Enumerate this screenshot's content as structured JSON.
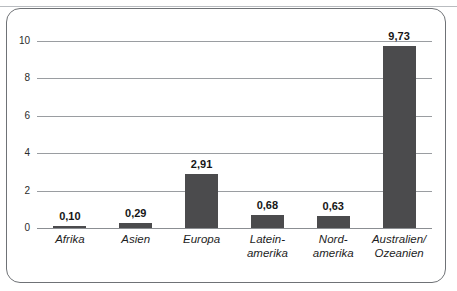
{
  "figure": {
    "frame_color": "#6f7276",
    "background": "#ffffff"
  },
  "chart_data": {
    "type": "bar",
    "title": "",
    "subtitle": "",
    "xlabel": "",
    "ylabel": "",
    "categories": [
      "Afrika",
      "Asien",
      "Europa",
      "Latein-\namerika",
      "Nord-\namerika",
      "Australien/\nOzeanien"
    ],
    "values": [
      0.1,
      0.29,
      2.91,
      0.68,
      0.63,
      9.73
    ],
    "value_labels": [
      "0,10",
      "0,29",
      "2,91",
      "0,68",
      "0,63",
      "9,73"
    ],
    "ylim": [
      0,
      10
    ],
    "yticks": [
      0,
      2,
      4,
      6,
      8,
      10
    ],
    "ytick_labels": [
      "0",
      "2",
      "4",
      "6",
      "8",
      "10"
    ],
    "grid": true,
    "grid_axis": "y",
    "legend": false,
    "legend_position": "none",
    "bar_color": "#4b4b4d",
    "gridline_color": "#9a9da1",
    "decimal_separator": ","
  }
}
